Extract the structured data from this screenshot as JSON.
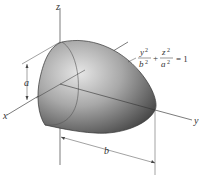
{
  "diagram": {
    "type": "paraboloid-of-revolution",
    "axes": {
      "x_label": "x",
      "y_label": "y",
      "z_label": "z"
    },
    "dimensions": {
      "a_label": "a",
      "b_label": "b"
    },
    "equation": {
      "num1": "y",
      "den1": "b",
      "exp": "2",
      "plus": "+",
      "num2": "z",
      "den2": "a",
      "equals": "= 1",
      "text": "y²/b² + z²/a² = 1"
    },
    "colors": {
      "body_light": "#d8d8d8",
      "body_dark": "#4a4a4a",
      "lines": "#333333"
    }
  }
}
